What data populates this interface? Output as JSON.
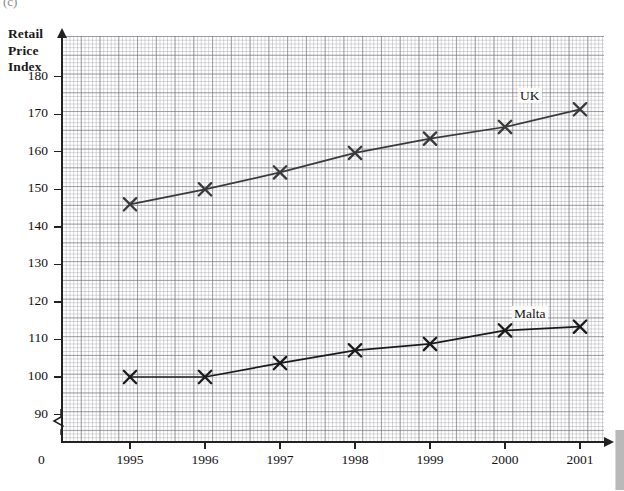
{
  "page": {
    "corner_mark": "(c)"
  },
  "axis": {
    "y_title_lines": [
      "Retail",
      "Price",
      "Index"
    ],
    "y_ticks": [
      180,
      170,
      160,
      150,
      140,
      130,
      120,
      110,
      100,
      90
    ],
    "origin_label": "0",
    "x_ticks": [
      "1995",
      "1996",
      "1997",
      "1998",
      "1999",
      "2000",
      "2001"
    ],
    "break_symbol": "axis-break-zigzag"
  },
  "chart_data": {
    "type": "line",
    "title": "Retail Price Index",
    "xlabel": "",
    "ylabel": "Retail Price Index",
    "categories": [
      "1995",
      "1996",
      "1997",
      "1998",
      "1999",
      "2000",
      "2001"
    ],
    "series": [
      {
        "name": "UK",
        "values": [
          146,
          150,
          154.5,
          159.7,
          163.5,
          166.6,
          171.3
        ],
        "marker": "cross",
        "color": "#3a3a3a"
      },
      {
        "name": "Malta",
        "values": [
          100,
          100,
          103.7,
          107.1,
          108.8,
          112.4,
          113.4
        ],
        "marker": "cross",
        "color": "#1a1a1a"
      }
    ],
    "ylim": [
      85,
      188
    ],
    "y_tick_step": 10,
    "grid": true,
    "grid_style": "graph-paper",
    "legend": "inline-labels",
    "axis_break_y": true
  }
}
